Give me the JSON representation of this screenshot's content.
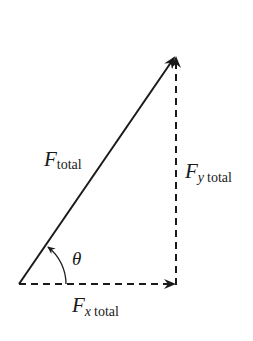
{
  "diagram": {
    "type": "vector-decomposition",
    "colors": {
      "stroke": "#1a1a1a",
      "background": "#ffffff"
    },
    "vectors": {
      "total": {
        "symbol": "F",
        "subscript": "total",
        "style": "solid"
      },
      "x_component": {
        "symbol": "F",
        "subscript_var": "x",
        "subscript": "total",
        "style": "dashed"
      },
      "y_component": {
        "symbol": "F",
        "subscript_var": "y",
        "subscript": "total",
        "style": "dashed"
      }
    },
    "angle": {
      "symbol": "θ"
    }
  }
}
